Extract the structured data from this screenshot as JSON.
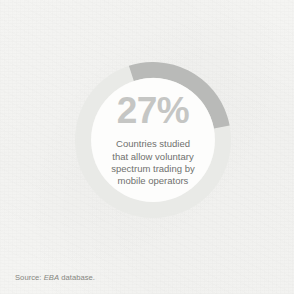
{
  "figure": {
    "background_color": "#f6f6f4"
  },
  "chart_data": {
    "type": "pie",
    "variant": "donut",
    "title": "",
    "subtitle": "",
    "xlabel": "",
    "ylabel": "",
    "legend_position": "none",
    "grid": false,
    "units": "percent",
    "total": 100,
    "start_angle_deg": -18,
    "direction": "clockwise",
    "inner_radius_ratio": 0.79,
    "categories": [
      "Countries studied that allow voluntary spectrum trading by mobile operators",
      "Remaining countries studied"
    ],
    "values": [
      27,
      73
    ],
    "colors": [
      "#b9bab8",
      "#e9eae7"
    ],
    "series": [
      {
        "name": "Share of countries studied",
        "values": [
          27,
          73
        ]
      }
    ],
    "annotations": [
      {
        "text": "27%",
        "position": "center",
        "role": "highlight-value"
      },
      {
        "text": "Countries studied that allow voluntary spectrum trading by mobile operators",
        "position": "center",
        "role": "highlight-caption"
      }
    ]
  },
  "center": {
    "value": "27%",
    "description_lines": [
      "Countries studied",
      "that allow voluntary",
      "spectrum trading by",
      "mobile operators"
    ]
  },
  "footer": {
    "source_prefix": "Source: ",
    "source_name": "EBA",
    "source_suffix": " database."
  },
  "colors": {
    "arc_highlight": "#b9bab8",
    "arc_track": "#e9eae7",
    "value_text": "#c5c6c4",
    "description_text": "#6f706e",
    "source_text": "#85867f",
    "donut_hole": "#fdfdfc"
  }
}
